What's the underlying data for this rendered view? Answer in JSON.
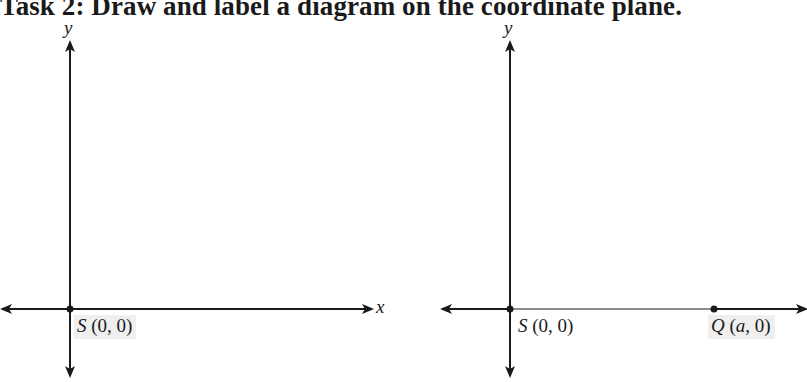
{
  "title": "Task 2: Draw and label a diagram on the coordinate plane.",
  "left_plane": {
    "y_axis_label": "y",
    "x_axis_label": "x",
    "points": [
      {
        "name": "S",
        "coords": "(0, 0)"
      }
    ]
  },
  "right_plane": {
    "y_axis_label": "y",
    "points": [
      {
        "name": "S",
        "coords": "(0, 0)"
      },
      {
        "name": "Q",
        "coords_open": "(",
        "coords_var": "a",
        "coords_close": ", 0)"
      }
    ],
    "segment": "SQ",
    "segment_color": "#8c8c8c"
  },
  "colors": {
    "axis": "#1a1a1a",
    "label_bg": "#efefef"
  }
}
